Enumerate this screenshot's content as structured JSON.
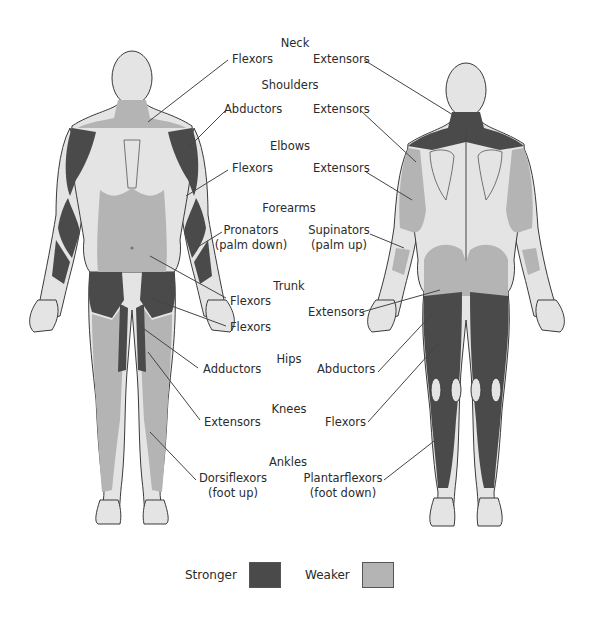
{
  "colors": {
    "stronger": "#4a4a4a",
    "weaker": "#b4b4b4",
    "skin": "#e4e4e4",
    "outline": "#3a3a3a",
    "leader": "#444444"
  },
  "groups": [
    {
      "region": "Neck",
      "left": [
        "Flexors"
      ],
      "right": [
        "Extensors"
      ]
    },
    {
      "region": "Shoulders",
      "left": [
        "Abductors"
      ],
      "right": [
        "Extensors"
      ]
    },
    {
      "region": "Elbows",
      "left": [
        "Flexors"
      ],
      "right": [
        "Extensors"
      ]
    },
    {
      "region": "Forearms",
      "left": [
        "Pronators",
        "(palm down)"
      ],
      "right": [
        "Supinators",
        "(palm up)"
      ]
    },
    {
      "region": "Trunk",
      "left": [
        "Flexors",
        "Flexors"
      ],
      "right": [
        "Extensors"
      ]
    },
    {
      "region": "Hips",
      "left": [
        "Adductors"
      ],
      "right": [
        "Abductors"
      ]
    },
    {
      "region": "Knees",
      "left": [
        "Extensors"
      ],
      "right": [
        "Flexors"
      ]
    },
    {
      "region": "Ankles",
      "left": [
        "Dorsiflexors",
        "(foot up)"
      ],
      "right": [
        "Plantarflexors",
        "(foot down)"
      ]
    }
  ],
  "labels": {
    "neck": "Neck",
    "neck_left": "Flexors",
    "neck_right": "Extensors",
    "shoulders": "Shoulders",
    "shoulders_left": "Abductors",
    "shoulders_right": "Extensors",
    "elbows": "Elbows",
    "elbows_left": "Flexors",
    "elbows_right": "Extensors",
    "forearms": "Forearms",
    "forearms_left_1": "Pronators",
    "forearms_left_2": "(palm down)",
    "forearms_right_1": "Supinators",
    "forearms_right_2": "(palm up)",
    "trunk": "Trunk",
    "trunk_left_1": "Flexors",
    "trunk_left_2": "Flexors",
    "trunk_right": "Extensors",
    "hips": "Hips",
    "hips_left": "Adductors",
    "hips_right": "Abductors",
    "knees": "Knees",
    "knees_left": "Extensors",
    "knees_right": "Flexors",
    "ankles": "Ankles",
    "ankles_left_1": "Dorsiflexors",
    "ankles_left_2": "(foot up)",
    "ankles_right_1": "Plantarflexors",
    "ankles_right_2": "(foot down)"
  },
  "legend": {
    "stronger_label": "Stronger",
    "weaker_label": "Weaker"
  },
  "figures": {
    "front": "anterior-view",
    "back": "posterior-view"
  }
}
